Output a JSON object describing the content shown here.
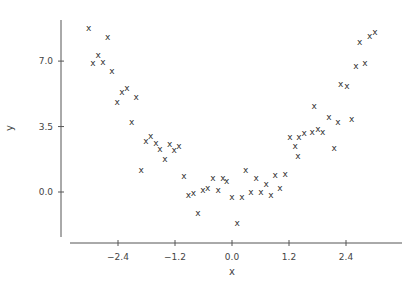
{
  "chart_data": {
    "type": "scatter",
    "title": "",
    "xlabel": "x",
    "ylabel": "y",
    "xlim": [
      -3.4,
      3.6
    ],
    "ylim": [
      -2.4,
      9.2
    ],
    "grid": false,
    "legend": null,
    "marker": "x",
    "x_ticks": [
      -2.4,
      -1.2,
      0.0,
      1.2,
      2.4
    ],
    "x_tick_labels": [
      "−2.4",
      "−1.2",
      "0.0",
      "1.2",
      "2.4"
    ],
    "y_ticks": [
      0.0,
      3.5,
      7.0
    ],
    "y_tick_labels": [
      "0.0",
      "3.5",
      "7.0"
    ],
    "series": [
      {
        "name": "data",
        "points": [
          [
            -3.02,
            8.77
          ],
          [
            -2.62,
            8.29
          ],
          [
            -2.82,
            7.33
          ],
          [
            -2.93,
            6.9
          ],
          [
            -2.72,
            6.95
          ],
          [
            -2.53,
            6.47
          ],
          [
            -2.32,
            5.35
          ],
          [
            -2.21,
            5.56
          ],
          [
            -2.42,
            4.81
          ],
          [
            -2.02,
            5.08
          ],
          [
            -2.11,
            3.74
          ],
          [
            -1.81,
            2.73
          ],
          [
            -1.71,
            2.99
          ],
          [
            -1.6,
            2.62
          ],
          [
            -1.52,
            2.3
          ],
          [
            -1.41,
            1.76
          ],
          [
            -1.31,
            2.57
          ],
          [
            -1.22,
            2.25
          ],
          [
            -1.12,
            2.46
          ],
          [
            -1.91,
            1.18
          ],
          [
            -1.01,
            0.86
          ],
          [
            -0.92,
            -0.16
          ],
          [
            -0.81,
            -0.05
          ],
          [
            -0.61,
            0.11
          ],
          [
            -0.51,
            0.21
          ],
          [
            -0.4,
            0.75
          ],
          [
            -0.29,
            0.11
          ],
          [
            -0.19,
            0.75
          ],
          [
            -0.11,
            0.59
          ],
          [
            -0.72,
            -1.12
          ],
          [
            0.0,
            -0.27
          ],
          [
            0.21,
            -0.27
          ],
          [
            0.29,
            1.18
          ],
          [
            0.4,
            0.0
          ],
          [
            0.51,
            0.75
          ],
          [
            0.61,
            0.0
          ],
          [
            0.72,
            0.43
          ],
          [
            0.82,
            -0.16
          ],
          [
            0.91,
            0.91
          ],
          [
            1.01,
            0.21
          ],
          [
            1.12,
            0.96
          ],
          [
            0.11,
            -1.66
          ],
          [
            1.22,
            2.94
          ],
          [
            1.41,
            2.94
          ],
          [
            1.52,
            3.16
          ],
          [
            1.33,
            2.46
          ],
          [
            1.39,
            1.93
          ],
          [
            1.69,
            3.21
          ],
          [
            1.81,
            3.37
          ],
          [
            1.91,
            3.21
          ],
          [
            2.15,
            2.35
          ],
          [
            2.04,
            4.01
          ],
          [
            1.73,
            4.6
          ],
          [
            2.52,
            3.9
          ],
          [
            2.23,
            3.74
          ],
          [
            2.29,
            5.77
          ],
          [
            2.42,
            5.67
          ],
          [
            2.61,
            6.74
          ],
          [
            2.8,
            6.9
          ],
          [
            2.69,
            8.02
          ],
          [
            2.9,
            8.34
          ],
          [
            3.01,
            8.56
          ]
        ]
      }
    ]
  }
}
